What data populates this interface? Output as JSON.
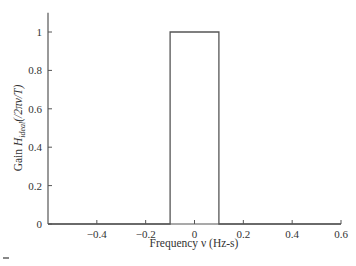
{
  "chart_data": {
    "type": "line",
    "title": "",
    "xlabel": "Frequency ν (Hz-s)",
    "ylabel_prefix": "Gain ",
    "ylabel_H": "H",
    "ylabel_sub": "ideal",
    "ylabel_suffix": "(/2πν/T)",
    "xlim": [
      -0.6,
      0.6
    ],
    "ylim": [
      0,
      1.1
    ],
    "grid": false,
    "legend": null,
    "x_ticks": [
      -0.4,
      -0.2,
      0,
      0.2,
      0.4,
      0.6
    ],
    "x_tick_labels": [
      "−0.4",
      "−0.2",
      "0",
      "0.2",
      "0.4",
      "0.6"
    ],
    "y_ticks": [
      0,
      0.2,
      0.4,
      0.6,
      0.8,
      1
    ],
    "y_tick_labels": [
      "0",
      "0.2",
      "0.4",
      "0.6",
      "0.8",
      "1"
    ],
    "series": [
      {
        "name": "ideal gain (rectangular pulse)",
        "x": [
          -0.6,
          -0.1,
          -0.1,
          0.1,
          0.1,
          0.6
        ],
        "y": [
          0,
          0,
          1,
          1,
          0,
          0
        ],
        "color": "#555555"
      }
    ]
  }
}
